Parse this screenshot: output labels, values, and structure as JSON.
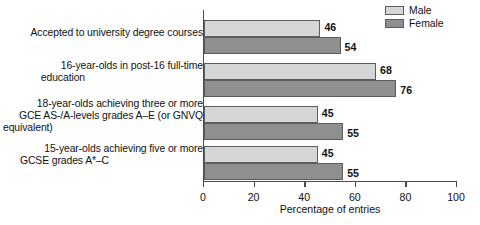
{
  "chart_data": {
    "type": "bar",
    "orientation": "horizontal",
    "title": "",
    "xlabel": "Percentage of entries",
    "ylabel": "",
    "xlim": [
      0,
      100
    ],
    "xticks": [
      0,
      20,
      40,
      60,
      80,
      100
    ],
    "grid": false,
    "legend_position": "top-right",
    "categories": [
      "Accepted to university degree courses",
      "16-year-olds in post-16 full-time education",
      "18-year-olds achieving three or more GCE AS-/A-levels grades A–E (or GNVQ equivalent)",
      "15-year-olds achieving five or more GCSE grades A*–C"
    ],
    "category_lines": [
      [
        "Accepted to university degree courses"
      ],
      [
        "16-year-olds in post-16 full-time",
        "education"
      ],
      [
        "18-year-olds achieving three or more",
        "GCE AS-/A-levels grades A–E (or GNVQ",
        "equivalent)"
      ],
      [
        "15-year-olds achieving five or more",
        "GCSE grades A*–C"
      ]
    ],
    "series": [
      {
        "name": "Male",
        "color": "#d6d6d6",
        "values": [
          46,
          68,
          45,
          45
        ]
      },
      {
        "name": "Female",
        "color": "#8f8f8f",
        "values": [
          54,
          76,
          55,
          55
        ]
      }
    ]
  },
  "legend": {
    "items": [
      {
        "label": "Male"
      },
      {
        "label": "Female"
      }
    ]
  }
}
